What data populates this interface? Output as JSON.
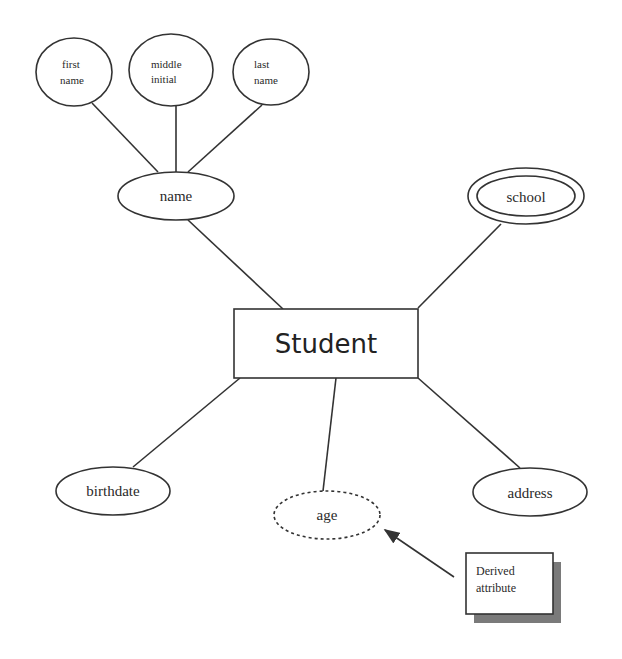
{
  "diagram": {
    "type": "ER diagram",
    "entity": {
      "label": "Student"
    },
    "attributes": [
      {
        "id": "name",
        "label": "name",
        "kind": "composite"
      },
      {
        "id": "first_name",
        "label_lines": [
          "first",
          "name"
        ],
        "kind": "component",
        "parent": "name"
      },
      {
        "id": "middle_initial",
        "label_lines": [
          "middle",
          "initial"
        ],
        "kind": "component",
        "parent": "name"
      },
      {
        "id": "last_name",
        "label_lines": [
          "last",
          "name"
        ],
        "kind": "component",
        "parent": "name"
      },
      {
        "id": "school",
        "label": "school",
        "kind": "multivalued"
      },
      {
        "id": "birthdate",
        "label": "birthdate",
        "kind": "simple"
      },
      {
        "id": "age",
        "label": "age",
        "kind": "derived"
      },
      {
        "id": "address",
        "label": "address",
        "kind": "simple"
      }
    ],
    "callout": {
      "label_lines": [
        "Derived",
        "attribute"
      ],
      "points_to": "age"
    }
  },
  "labels": {
    "student": "Student",
    "name": "name",
    "first_1": "first",
    "first_2": "name",
    "middle_1": "middle",
    "middle_2": "initial",
    "last_1": "last",
    "last_2": "name",
    "school": "school",
    "birthdate": "birthdate",
    "age": "age",
    "address": "address",
    "callout_1": "Derived",
    "callout_2": "attribute"
  },
  "colors": {
    "stroke": "#333333",
    "shadow": "#7a7a7a",
    "background": "#ffffff"
  }
}
